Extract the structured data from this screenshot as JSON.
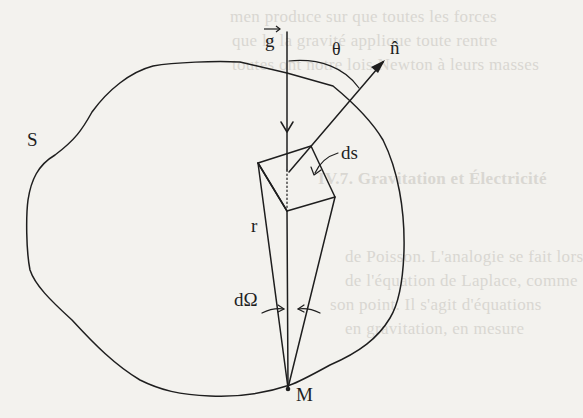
{
  "diagram": {
    "labels": {
      "surface": "S",
      "gravity_vector": "g",
      "normal_vector": "n̂",
      "angle": "θ",
      "surface_element": "ds",
      "distance": "r",
      "solid_angle": "dΩ",
      "point": "M"
    },
    "colors": {
      "ink": "#1e1e1e",
      "paper": "#f3f2ee",
      "bleed_text": "#d9d7d2"
    }
  },
  "background_bleed_text": [
    "men produce sur que toutes les forces",
    "que le la gravité applique toute rentre",
    "toutes ont notre lois Newton à leurs masses",
    "IV.7. Gravitation et Électricité",
    "de Poisson. L'analogie se fait lors",
    "de l'équation de Laplace, comme",
    "son point. Il s'agit d'équations",
    "en gravitation, en mesure"
  ]
}
